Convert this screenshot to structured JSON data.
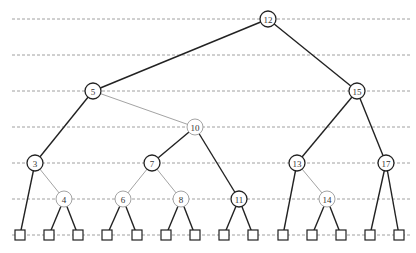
{
  "diagram": {
    "type": "binary-search-tree",
    "level_lines_y": [
      19,
      55,
      91,
      127,
      163,
      199,
      235
    ],
    "nodes": [
      {
        "id": "12",
        "label": "12",
        "x": 268,
        "y": 19,
        "style": "dark"
      },
      {
        "id": "5",
        "label": "5",
        "x": 93,
        "y": 91,
        "style": "dark"
      },
      {
        "id": "15",
        "label": "15",
        "x": 357,
        "y": 91,
        "style": "dark"
      },
      {
        "id": "10",
        "label": "10",
        "x": 195,
        "y": 127,
        "style": "light"
      },
      {
        "id": "3",
        "label": "3",
        "x": 35,
        "y": 163,
        "style": "dark"
      },
      {
        "id": "7",
        "label": "7",
        "x": 152,
        "y": 163,
        "style": "dark"
      },
      {
        "id": "13",
        "label": "13",
        "x": 297,
        "y": 163,
        "style": "dark"
      },
      {
        "id": "17",
        "label": "17",
        "x": 386,
        "y": 163,
        "style": "dark"
      },
      {
        "id": "4",
        "label": "4",
        "x": 64,
        "y": 199,
        "style": "light"
      },
      {
        "id": "6",
        "label": "6",
        "x": 123,
        "y": 199,
        "style": "light"
      },
      {
        "id": "8",
        "label": "8",
        "x": 181,
        "y": 199,
        "style": "light"
      },
      {
        "id": "11",
        "label": "11",
        "x": 239,
        "y": 199,
        "style": "dark"
      },
      {
        "id": "14",
        "label": "14",
        "x": 327,
        "y": 199,
        "style": "light"
      }
    ],
    "leaves": [
      {
        "id": "L1",
        "x": 20,
        "y": 235,
        "parent": "3"
      },
      {
        "id": "L2",
        "x": 49,
        "y": 235,
        "parent": "4"
      },
      {
        "id": "L3",
        "x": 78,
        "y": 235,
        "parent": "4"
      },
      {
        "id": "L4",
        "x": 107,
        "y": 235,
        "parent": "6"
      },
      {
        "id": "L5",
        "x": 137,
        "y": 235,
        "parent": "6"
      },
      {
        "id": "L6",
        "x": 166,
        "y": 235,
        "parent": "8"
      },
      {
        "id": "L7",
        "x": 195,
        "y": 235,
        "parent": "8"
      },
      {
        "id": "L8",
        "x": 224,
        "y": 235,
        "parent": "11"
      },
      {
        "id": "L9",
        "x": 253,
        "y": 235,
        "parent": "11"
      },
      {
        "id": "L10",
        "x": 283,
        "y": 235,
        "parent": "13"
      },
      {
        "id": "L11",
        "x": 312,
        "y": 235,
        "parent": "14"
      },
      {
        "id": "L12",
        "x": 341,
        "y": 235,
        "parent": "14"
      },
      {
        "id": "L13",
        "x": 370,
        "y": 235,
        "parent": "17"
      },
      {
        "id": "L14",
        "x": 399,
        "y": 235,
        "parent": "17"
      }
    ],
    "edges": [
      {
        "from": "12",
        "to": "5",
        "style": "dark"
      },
      {
        "from": "12",
        "to": "15",
        "style": "dark"
      },
      {
        "from": "5",
        "to": "3",
        "style": "dark"
      },
      {
        "from": "5",
        "to": "10",
        "style": "light"
      },
      {
        "from": "10",
        "to": "7",
        "style": "dark"
      },
      {
        "from": "10",
        "to": "11",
        "style": "dark"
      },
      {
        "from": "3",
        "to": "4",
        "style": "light"
      },
      {
        "from": "7",
        "to": "6",
        "style": "light"
      },
      {
        "from": "7",
        "to": "8",
        "style": "light"
      },
      {
        "from": "15",
        "to": "13",
        "style": "dark"
      },
      {
        "from": "15",
        "to": "17",
        "style": "dark"
      },
      {
        "from": "13",
        "to": "14",
        "style": "light"
      }
    ],
    "node_radius": 8,
    "leaf_size": 10
  }
}
